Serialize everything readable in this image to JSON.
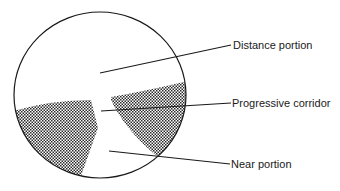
{
  "figure": {
    "type": "progressive-lens-zone-diagram",
    "labels": {
      "distance": "Distance portion",
      "corridor": "Progressive corridor",
      "near": "Near portion"
    },
    "colors": {
      "outline": "#1a1a1a",
      "shading": "#2b2b2b",
      "background": "#ffffff"
    }
  }
}
